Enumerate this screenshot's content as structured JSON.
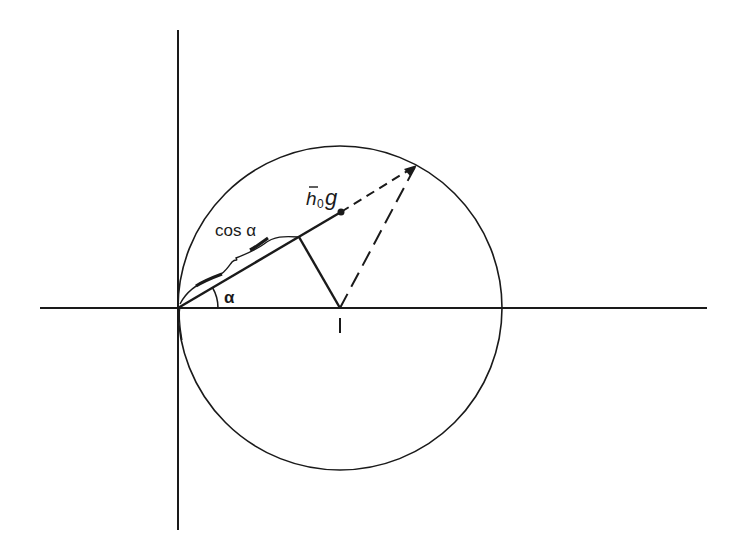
{
  "diagram": {
    "type": "geometric construction",
    "colors": {
      "stroke": "#1a1a1a",
      "background": "#ffffff"
    },
    "labels": {
      "cos_alpha": "cos α",
      "alpha": "α",
      "h": "h",
      "h_sub": "0",
      "g": "g",
      "unit_mark": "1"
    },
    "axes": {
      "origin": [
        178,
        308
      ],
      "horizontal": {
        "x1": 40,
        "x2": 707,
        "y": 308
      },
      "vertical": {
        "x": 178,
        "y1": 30,
        "y2": 530
      }
    },
    "circle": {
      "cx": 340,
      "cy": 308,
      "r": 162
    },
    "angle_alpha_deg": 30.5,
    "points": {
      "origin": [
        178,
        308
      ],
      "circle_center": [
        340,
        308
      ],
      "foot_of_perpendicular": [
        299,
        237
      ],
      "h0g_point": [
        341,
        212
      ],
      "circle_intersection": [
        417,
        165
      ]
    }
  }
}
